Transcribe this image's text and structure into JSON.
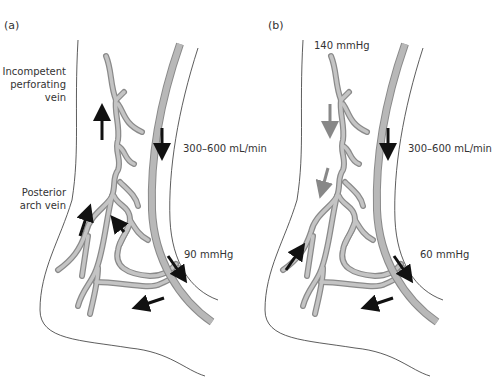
{
  "colors": {
    "vein": "#b3b3b3",
    "vein_outline": "#8a8a8a",
    "outline": "#333333",
    "arrow_dark": "#111111",
    "arrow_grey": "#888888"
  },
  "panel_a": {
    "label": "(a)",
    "incompetent_label_1": "Incompetent",
    "incompetent_label_2": "perforating",
    "incompetent_label_3": "vein",
    "posterior_label_1": "Posterior",
    "posterior_label_2": "arch vein",
    "flow_label": "300–600 mL/min",
    "pressure_label": "90 mmHg"
  },
  "panel_b": {
    "label": "(b)",
    "top_pressure_label": "140 mmHg",
    "flow_label": "300–600 mL/min",
    "pressure_label": "60 mmHg"
  }
}
